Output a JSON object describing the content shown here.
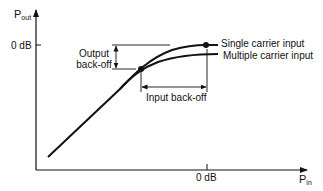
{
  "diagram": {
    "type": "amplifier transfer characteristic",
    "y_axis": {
      "label_main": "P",
      "label_sub": "out",
      "tick_label": "0 dB"
    },
    "x_axis": {
      "label_main": "P",
      "label_sub": "in",
      "tick_label": "0 dB"
    },
    "curves": [
      {
        "name": "single-carrier",
        "label": "Single carrier input"
      },
      {
        "name": "multiple-carrier",
        "label": "Multiple carrier input"
      }
    ],
    "annotations": {
      "output_backoff_line1": "Output",
      "output_backoff_line2": "back-off",
      "input_backoff": "Input back-off"
    },
    "colors": {
      "ink": "#111111",
      "background": "#ffffff"
    }
  }
}
